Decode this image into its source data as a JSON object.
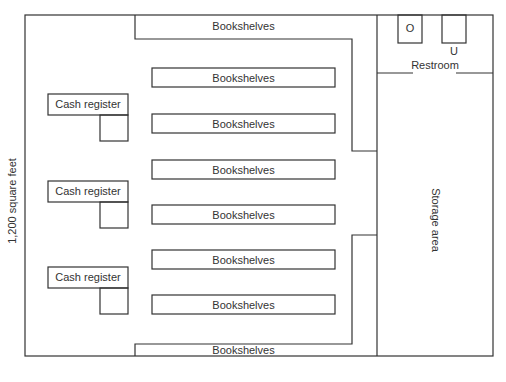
{
  "diagram": {
    "type": "floor-plan",
    "area_label": "1,200 square feet",
    "line_color": "#333333",
    "background": "#ffffff",
    "shelves": [
      {
        "label": "Bookshelves",
        "position": "top-wall"
      },
      {
        "label": "Bookshelves",
        "position": "row-1"
      },
      {
        "label": "Bookshelves",
        "position": "row-2"
      },
      {
        "label": "Bookshelves",
        "position": "row-3"
      },
      {
        "label": "Bookshelves",
        "position": "row-4"
      },
      {
        "label": "Bookshelves",
        "position": "row-5"
      },
      {
        "label": "Bookshelves",
        "position": "row-6"
      },
      {
        "label": "Bookshelves",
        "position": "bottom-wall"
      }
    ],
    "cash_registers": [
      {
        "label": "Cash register"
      },
      {
        "label": "Cash register"
      },
      {
        "label": "Cash register"
      }
    ],
    "restroom": {
      "label": "Restroom",
      "fixtures": [
        {
          "label": "O"
        },
        {
          "label": "U"
        }
      ]
    },
    "storage": {
      "label": "Storage area"
    }
  }
}
